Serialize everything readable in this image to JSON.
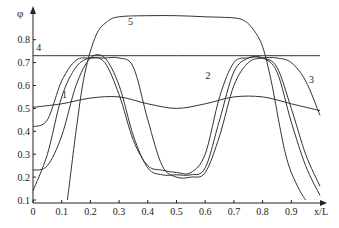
{
  "chart_data": {
    "type": "line",
    "title": "",
    "xlabel": "x/L",
    "ylabel": "φ",
    "xlim": [
      0,
      1.0
    ],
    "ylim": [
      0.1,
      0.9
    ],
    "xticks": [
      "0",
      "0.1",
      "0.2",
      "0.3",
      "0.4",
      "0.5",
      "0.6",
      "0.7",
      "0.8",
      "0.9"
    ],
    "yticks": [
      "0.1",
      "0.2",
      "0.3",
      "0.4",
      "0.5",
      "0.6",
      "0.7",
      "0.8"
    ],
    "grid": false,
    "legend": "inline curve numbers",
    "series": [
      {
        "name": "1",
        "label_pos": [
          0.11,
          0.545
        ],
        "x": [
          0,
          0.1,
          0.2,
          0.3,
          0.4,
          0.5,
          0.6,
          0.7,
          0.8,
          0.9,
          1.0
        ],
        "values": [
          0.505,
          0.52,
          0.545,
          0.55,
          0.52,
          0.5,
          0.52,
          0.55,
          0.55,
          0.52,
          0.49
        ]
      },
      {
        "name": "2",
        "label_pos": [
          0.61,
          0.63
        ],
        "x": [
          0,
          0.05,
          0.1,
          0.15,
          0.2,
          0.25,
          0.3,
          0.35,
          0.4,
          0.45,
          0.5,
          0.55,
          0.6,
          0.65,
          0.7,
          0.75,
          0.8,
          0.85,
          0.9,
          0.95,
          1.0
        ],
        "values": [
          0.23,
          0.25,
          0.38,
          0.6,
          0.72,
          0.72,
          0.6,
          0.38,
          0.24,
          0.21,
          0.21,
          0.21,
          0.24,
          0.45,
          0.66,
          0.72,
          0.72,
          0.68,
          0.5,
          0.3,
          0.16
        ]
      },
      {
        "name": "3",
        "label_pos": [
          0.97,
          0.61
        ],
        "x": [
          0,
          0.05,
          0.1,
          0.15,
          0.2,
          0.25,
          0.3,
          0.35,
          0.4,
          0.45,
          0.5,
          0.55,
          0.6,
          0.65,
          0.7,
          0.75,
          0.8,
          0.85,
          0.9,
          0.95,
          1.0
        ],
        "values": [
          0.42,
          0.45,
          0.62,
          0.71,
          0.72,
          0.72,
          0.72,
          0.68,
          0.45,
          0.25,
          0.2,
          0.2,
          0.22,
          0.38,
          0.6,
          0.7,
          0.72,
          0.72,
          0.7,
          0.62,
          0.47
        ]
      },
      {
        "name": "4",
        "label_pos": [
          0.02,
          0.75
        ],
        "x": [
          0,
          0.1,
          0.2,
          0.3,
          0.4,
          0.5,
          0.6,
          0.7,
          0.8,
          0.9,
          1.0
        ],
        "values": [
          0.73,
          0.73,
          0.73,
          0.73,
          0.73,
          0.73,
          0.73,
          0.73,
          0.73,
          0.73,
          0.73
        ]
      },
      {
        "name": "5",
        "label_pos": [
          0.34,
          0.865
        ],
        "x": [
          0.12,
          0.15,
          0.18,
          0.22,
          0.26,
          0.3,
          0.4,
          0.5,
          0.6,
          0.7,
          0.74,
          0.77,
          0.8,
          0.83,
          0.86,
          0.88,
          0.9,
          0.93,
          0.95
        ],
        "values": [
          0.1,
          0.4,
          0.65,
          0.82,
          0.88,
          0.9,
          0.905,
          0.905,
          0.9,
          0.895,
          0.88,
          0.84,
          0.77,
          0.62,
          0.42,
          0.3,
          0.22,
          0.14,
          0.1
        ]
      },
      {
        "name": "unlabeled",
        "label_pos": null,
        "x": [
          0,
          0.05,
          0.1,
          0.15,
          0.2,
          0.25,
          0.3,
          0.35,
          0.4,
          0.45,
          0.5,
          0.55,
          0.6,
          0.65,
          0.7,
          0.75,
          0.8,
          0.85,
          0.9,
          0.95,
          1.0
        ],
        "values": [
          0.14,
          0.3,
          0.55,
          0.68,
          0.72,
          0.7,
          0.56,
          0.36,
          0.25,
          0.23,
          0.22,
          0.22,
          0.3,
          0.55,
          0.7,
          0.72,
          0.72,
          0.66,
          0.44,
          0.25,
          0.12
        ]
      }
    ]
  }
}
